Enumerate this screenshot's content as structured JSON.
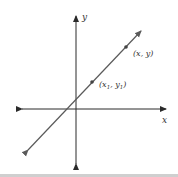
{
  "diagram": {
    "type": "coordinate-plane-line",
    "axes": {
      "x_label": "x",
      "y_label": "y"
    },
    "points": [
      {
        "name": "point-x1-y1",
        "label": "(x",
        "sub1": "1",
        "mid": ", y",
        "sub2": "1",
        "end": ")"
      },
      {
        "name": "point-x-y",
        "label": "(x, y)"
      }
    ],
    "colors": {
      "axis": "#2a2a2a",
      "line": "#5a5a5a",
      "text": "#333333",
      "bottom_bar": "#cfcfcf"
    }
  }
}
